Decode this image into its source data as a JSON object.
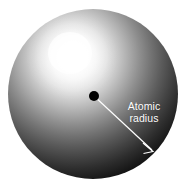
{
  "figure": {
    "name": "atomic-radius-diagram",
    "background_color": "#ffffff",
    "width": 188,
    "height": 195
  },
  "sphere": {
    "name": "atom-sphere",
    "center_x": 93,
    "center_y": 94,
    "radius": 85,
    "highlight_x": 72,
    "highlight_y": 56,
    "highlight_color": "#ffffff",
    "mid_color": "#8a8a8a",
    "edge_color": "#000000"
  },
  "nucleus": {
    "name": "nucleus-dot",
    "center_x": 94,
    "center_y": 96,
    "radius": 5,
    "color": "#000000"
  },
  "radius_arrow": {
    "name": "atomic-radius-arrow",
    "start_x": 94,
    "start_y": 96,
    "end_x": 153,
    "end_y": 151,
    "color": "#ffffff",
    "stroke_width": 1.2
  },
  "annotation": {
    "label_line_1": "Atomic",
    "label_line_2": "radius",
    "color": "#ffffff"
  }
}
